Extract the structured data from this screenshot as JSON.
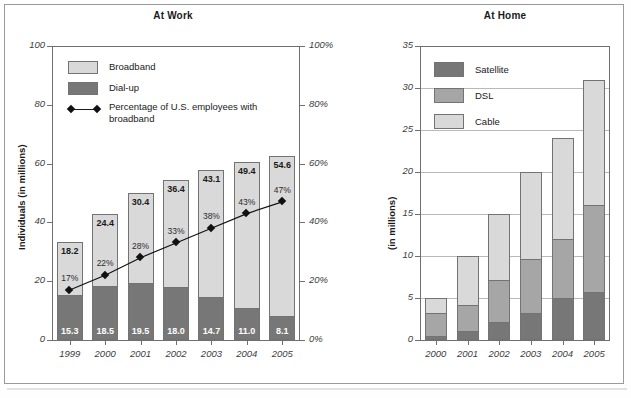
{
  "figure": {
    "caption_source": "",
    "colors": {
      "light_gray": "#d9d9d9",
      "mid_gray": "#a6a6a6",
      "dark_gray": "#777777",
      "axis": "#6f6f6f",
      "grid": "#b9b9b9",
      "text": "#1a1a1a"
    }
  },
  "chart_data": [
    {
      "type": "bar",
      "id": "at-work",
      "title": "At Work",
      "xlabel": "",
      "ylabel": "Individuals (in millions)",
      "ylabel_right": "",
      "ylim": [
        0,
        100
      ],
      "yticks": [
        0,
        20,
        40,
        60,
        80,
        100
      ],
      "ytick_labels": [
        "0",
        "20",
        "40",
        "60",
        "80",
        "100"
      ],
      "ylim_right": [
        0,
        100
      ],
      "yticks_right": [
        0,
        20,
        40,
        60,
        80,
        100
      ],
      "ytick_labels_right": [
        "0%",
        "20%",
        "40%",
        "60%",
        "80%",
        "100%"
      ],
      "grid": false,
      "stacked": true,
      "categories": [
        "1999",
        "2000",
        "2001",
        "2002",
        "2003",
        "2004",
        "2005"
      ],
      "series": [
        {
          "name": "Dial-up",
          "color": "#777777",
          "values": [
            15.3,
            18.5,
            19.5,
            18.0,
            14.7,
            11.0,
            8.1
          ],
          "labels": [
            "15.3",
            "18.5",
            "19.5",
            "18.0",
            "14.7",
            "11.0",
            "8.1"
          ]
        },
        {
          "name": "Broadband",
          "color": "#d9d9d9",
          "values": [
            18.2,
            24.4,
            30.4,
            36.4,
            43.1,
            49.4,
            54.6
          ],
          "labels": [
            "18.2",
            "24.4",
            "30.4",
            "36.4",
            "43.1",
            "49.4",
            "54.6"
          ]
        }
      ],
      "line_series": {
        "name": "Percentage of U.S. employees with broadband",
        "values": [
          17,
          22,
          28,
          33,
          38,
          43,
          47
        ],
        "labels": [
          "17%",
          "22%",
          "28%",
          "33%",
          "38%",
          "43%",
          "47%"
        ],
        "axis": "right",
        "marker": "diamond",
        "color": "#111111"
      },
      "legend": {
        "position": "top-left",
        "entries": [
          {
            "label": "Broadband",
            "swatch": "light"
          },
          {
            "label": "Dial-up",
            "swatch": "dark"
          },
          {
            "label": "Percentage of U.S. employees with broadband",
            "swatch": "line-diamond"
          }
        ]
      }
    },
    {
      "type": "bar",
      "id": "at-home",
      "title": "At Home",
      "xlabel": "",
      "ylabel": "(in millions)",
      "ylim": [
        0,
        35
      ],
      "yticks": [
        0,
        5,
        10,
        15,
        20,
        25,
        30,
        35
      ],
      "ytick_labels": [
        "0",
        "5",
        "10",
        "15",
        "20",
        "25",
        "30",
        "35"
      ],
      "grid": true,
      "stacked": true,
      "categories": [
        "2000",
        "2001",
        "2002",
        "2003",
        "2004",
        "2005"
      ],
      "series": [
        {
          "name": "Satellite",
          "color": "#777777",
          "values": [
            0.5,
            1.1,
            2.2,
            3.2,
            5.0,
            5.7
          ]
        },
        {
          "name": "DSL",
          "color": "#a6a6a6",
          "values": [
            2.7,
            3.1,
            5.0,
            6.5,
            7.0,
            10.4
          ]
        },
        {
          "name": "Cable",
          "color": "#d9d9d9",
          "values": [
            1.8,
            5.8,
            7.8,
            10.3,
            12.0,
            14.9
          ]
        }
      ],
      "totals": [
        5.0,
        10.0,
        15.0,
        20.0,
        24.0,
        31.0
      ],
      "legend": {
        "position": "top-left",
        "entries": [
          {
            "label": "Satellite",
            "swatch": "dark"
          },
          {
            "label": "DSL",
            "swatch": "mid"
          },
          {
            "label": "Cable",
            "swatch": "light"
          }
        ]
      }
    }
  ]
}
